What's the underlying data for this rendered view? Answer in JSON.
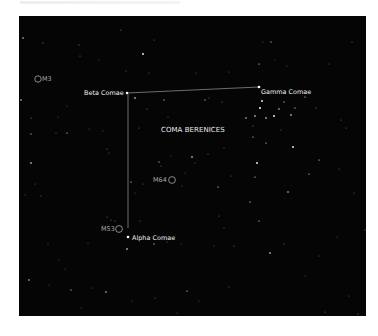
{
  "chart": {
    "constellation_label": "COMA BERENICES",
    "background_color": "#050505",
    "line_color": "#9a9a9a",
    "star_color": "#ffffff",
    "stars_named": [
      {
        "name": "Beta Comae",
        "x": 108,
        "y": 77
      },
      {
        "name": "Gamma Comae",
        "x": 240,
        "y": 71
      },
      {
        "name": "Alpha Comae",
        "x": 109,
        "y": 221
      }
    ],
    "deep_sky_objects": [
      {
        "name": "M3",
        "x": 19,
        "y": 63
      },
      {
        "name": "M64",
        "x": 153,
        "y": 164
      },
      {
        "name": "M53",
        "x": 101,
        "y": 213
      }
    ],
    "lines": [
      {
        "from": "Beta Comae",
        "to": "Gamma Comae"
      },
      {
        "from": "Beta Comae",
        "to": "Alpha Comae"
      }
    ]
  },
  "labels": {
    "beta": "Beta Comae",
    "gamma": "Gamma Comae",
    "alpha": "Alpha Comae",
    "title": "COMA BERENICES",
    "m3": "M3",
    "m64": "M64",
    "m53": "M53"
  }
}
